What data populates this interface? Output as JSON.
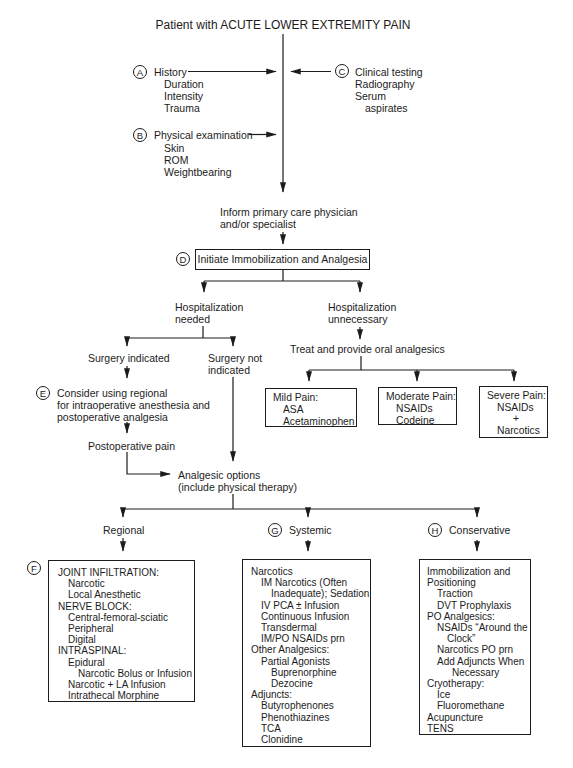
{
  "title": "Patient with ACUTE LOWER EXTREMITY PAIN",
  "style": {
    "ink_color": "#1c1c1c",
    "background": "#ffffff"
  },
  "steps": {
    "history": {
      "letter": "A",
      "label": "History",
      "items": [
        "Duration",
        "Intensity",
        "Trauma"
      ]
    },
    "physical_exam": {
      "letter": "B",
      "label": "Physical examination",
      "items": [
        "Skin",
        "ROM",
        "Weightbearing"
      ]
    },
    "clinical_testing": {
      "letter": "C",
      "label": "Clinical testing",
      "items": [
        "Radiography",
        "Serum",
        "aspirates"
      ]
    },
    "inform": {
      "line1": "Inform primary care physician",
      "line2": "and/or specialist"
    },
    "initiate": {
      "letter": "D",
      "label": "Initiate Immobilization and Analgesia"
    },
    "hospitalization_needed": {
      "line1": "Hospitalization",
      "line2": "needed"
    },
    "hospitalization_unnecessary": {
      "line1": "Hospitalization",
      "line2": "unnecessary"
    },
    "surgery_indicated": {
      "label": "Surgery indicated"
    },
    "surgery_not_indicated": {
      "line1": "Surgery not",
      "line2": "indicated"
    },
    "consider_regional": {
      "letter": "E",
      "line1": "Consider using regional",
      "line2": "for intraoperative anesthesia and",
      "line3": "postoperative analgesia"
    },
    "postoperative_pain": {
      "label": "Postoperative pain"
    },
    "treat_oral": {
      "label": "Treat and provide oral analgesics"
    },
    "analgesic_options": {
      "line1": "Analgesic options",
      "line2": "(include physical therapy)"
    }
  },
  "pain_boxes": {
    "mild": {
      "title": "Mild Pain:",
      "items": [
        "ASA",
        "Acetaminophen"
      ]
    },
    "moderate": {
      "title": "Moderate Pain:",
      "items": [
        "NSAIDs",
        "Codeine"
      ]
    },
    "severe": {
      "title": "Severe Pain:",
      "items": [
        "NSAIDs",
        "+",
        "Narcotics"
      ]
    }
  },
  "branches": {
    "regional": {
      "label": "Regional"
    },
    "systemic": {
      "letter": "G",
      "label": "Systemic"
    },
    "conservative": {
      "letter": "H",
      "label": "Conservative"
    }
  },
  "option_boxes": {
    "regional": {
      "letter": "F",
      "lines": [
        "JOINT INFILTRATION:",
        "Narcotic",
        "Local Anesthetic",
        "NERVE BLOCK:",
        "Central-femoral-sciatic",
        "Peripheral",
        "Digital",
        "INTRASPINAL:",
        "Epidural",
        "Narcotic Bolus or Infusion",
        "Narcotic + LA Infusion",
        "Intrathecal Morphine"
      ]
    },
    "systemic": {
      "lines": [
        "Narcotics",
        "IM Narcotics (Often",
        "Inadequate); Sedation",
        "IV PCA ± Infusion",
        "Continuous Infusion",
        "Transdermal",
        "IM/PO NSAIDs prn",
        "Other Analgesics:",
        "Partial Agonists",
        "Buprenorphine",
        "Dezocine",
        "Adjuncts:",
        "Butyrophenones",
        "Phenothiazines",
        "TCA",
        "Clonidine"
      ]
    },
    "conservative": {
      "lines": [
        "Immobilization and",
        "Positioning",
        "Traction",
        "DVT Prophylaxis",
        "PO Analgesics:",
        "NSAIDs “Around the",
        "Clock”",
        "Narcotics PO prn",
        "Add Adjuncts When",
        "Necessary",
        "Cryotherapy:",
        "Ice",
        "Fluoromethane",
        "Acupuncture",
        "TENS"
      ]
    }
  }
}
